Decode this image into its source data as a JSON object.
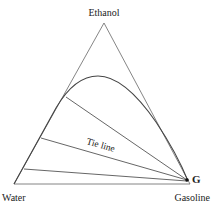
{
  "diagram": {
    "type": "ternary-phase-diagram",
    "vertices": {
      "top": "Ethanol",
      "bottom_left": "Water",
      "bottom_right": "Gasoline"
    },
    "annotations": {
      "tie_line_label": "Tie line",
      "point_label": "G"
    },
    "colors": {
      "line": "#555555",
      "curve": "#444444",
      "text": "#222222",
      "point": "#111111"
    }
  }
}
